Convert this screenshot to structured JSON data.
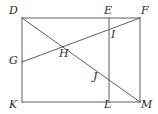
{
  "figure": {
    "type": "geometry-diagram",
    "stroke_color": "#4d4d4d",
    "label_color": "#2b2b2b",
    "background_color": "#ffffff",
    "width": 158,
    "height": 114,
    "points": [
      {
        "id": "D",
        "label": "D",
        "x": 22,
        "y": 18,
        "label_x": 9,
        "label_y": 5,
        "kind": "rectangle-corner"
      },
      {
        "id": "E",
        "label": "E",
        "x": 109,
        "y": 18,
        "label_x": 104,
        "label_y": 5,
        "kind": "edge-point"
      },
      {
        "id": "F",
        "label": "F",
        "x": 140,
        "y": 18,
        "label_x": 141,
        "label_y": 5,
        "kind": "rectangle-corner"
      },
      {
        "id": "G",
        "label": "G",
        "x": 22,
        "y": 62,
        "label_x": 9,
        "label_y": 55,
        "kind": "edge-point"
      },
      {
        "id": "H",
        "label": "H",
        "x": 62,
        "y": 47,
        "label_x": 59,
        "label_y": 48,
        "kind": "intersection"
      },
      {
        "id": "I",
        "label": "I",
        "x": 109,
        "y": 30,
        "label_x": 111,
        "label_y": 29,
        "kind": "intersection"
      },
      {
        "id": "J",
        "label": "J",
        "x": 109,
        "y": 80,
        "label_x": 93,
        "label_y": 71,
        "kind": "intersection"
      },
      {
        "id": "K",
        "label": "K",
        "x": 22,
        "y": 102,
        "label_x": 9,
        "label_y": 99,
        "kind": "rectangle-corner"
      },
      {
        "id": "L",
        "label": "L",
        "x": 109,
        "y": 102,
        "label_x": 104,
        "label_y": 99,
        "kind": "edge-point"
      },
      {
        "id": "M",
        "label": "M",
        "x": 140,
        "y": 102,
        "label_x": 141,
        "label_y": 99,
        "kind": "rectangle-corner"
      }
    ],
    "segments": [
      {
        "id": "DF",
        "from": "D",
        "to": "F",
        "role": "rectangle-top-edge"
      },
      {
        "id": "FM",
        "from": "F",
        "to": "M",
        "role": "rectangle-right-edge"
      },
      {
        "id": "MK",
        "from": "M",
        "to": "K",
        "role": "rectangle-bottom-edge"
      },
      {
        "id": "KD",
        "from": "K",
        "to": "D",
        "role": "rectangle-left-edge"
      },
      {
        "id": "EL",
        "from": "E",
        "to": "L",
        "role": "vertical-divider"
      },
      {
        "id": "GF",
        "from": "G",
        "to": "F",
        "role": "diagonal"
      },
      {
        "id": "DM",
        "from": "D",
        "to": "M",
        "role": "diagonal"
      }
    ]
  }
}
